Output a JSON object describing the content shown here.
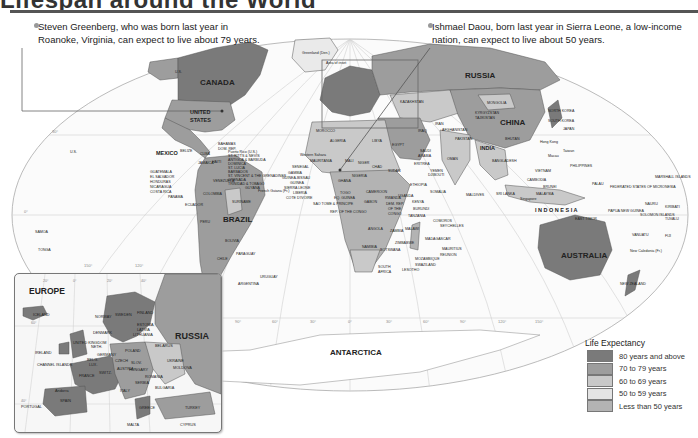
{
  "header": {
    "title": "Lifespan around the World"
  },
  "callouts": [
    {
      "id": "left",
      "text_line1": "Steven Greenberg, who was born last year in",
      "text_line2": "Roanoke, Virginia, can expect to live about 79 years."
    },
    {
      "id": "right",
      "text_line1": "Ishmael Daou, born last year in Sierra Leone, a low-income",
      "text_line2": "nation, can expect to live about 50 years."
    }
  ],
  "map": {
    "labels": {
      "canada": "CANADA",
      "us": "UNITED",
      "us2": "STATES",
      "russia": "RUSSIA",
      "china": "CHINA",
      "brazil": "BRAZIL",
      "australia": "AUSTRALIA",
      "antarctica": "ANTARCTICA",
      "indonesia": "I N D O N E S I A",
      "mexico": "MEXICO",
      "india": "INDIA",
      "mongolia": "MONGOLIA",
      "kazakhstan": "KAZAKHSTAN",
      "algeria": "ALGERIA",
      "libya": "LIBYA",
      "egypt": "EGYPT",
      "morocco": "MOROCCO",
      "sudan": "SUDAN",
      "chad": "CHAD",
      "niger": "NIGER",
      "mali": "MALI",
      "mauritania": "MAURITANIA",
      "nigeria": "NIGERIA",
      "ethiopia": "ETHIOPIA",
      "somalia": "SOMALIA",
      "kenya": "KENYA",
      "tanzania": "TANZANIA",
      "angola": "ANGOLA",
      "zambia": "ZAMBIA",
      "namibia": "NAMIBIA",
      "botswana": "BOTSWANA",
      "south_africa": "SOUTH",
      "south_africa2": "AFRICA",
      "madagascar": "MADAGASCAR",
      "mozambique": "MOZAMBIQUE",
      "drc": "DEM. REP.",
      "drc2": "OF THE",
      "drc3": "CONGO",
      "saudi": "SAUDI",
      "saudi2": "ARABIA",
      "iran": "IRAN",
      "iraq": "IRAQ",
      "pakistan": "PAKISTAN",
      "afghanistan": "AFGHANISTAN",
      "oman": "OMAN",
      "yemen": "YEMEN",
      "peru": "PERU",
      "bolivia": "BOLIVIA",
      "chile": "CHILE",
      "argentina": "ARGENTINA",
      "paraguay": "PARAGUAY",
      "uruguay": "URUGUAY",
      "colombia": "COLOMBIA",
      "venezuela": "VENEZUELA",
      "ecuador": "ECUADOR",
      "suriname": "SURINAME",
      "french_guiana": "French Guiana (Fr.)",
      "guatemala": "GUATEMALA",
      "el_salvador": "EL SALVADOR",
      "honduras": "HONDURAS",
      "nicaragua": "NICARAGUA",
      "costa_rica": "COSTA RICA",
      "panama": "PANAMA",
      "cuba": "CUBA",
      "belize": "BELIZE",
      "bahamas": "BAHAMAS",
      "dom_rep": "DOM. REP.",
      "jamaica": "JAMAICA",
      "haiti": "HAITI",
      "philippines": "PHILIPPINES",
      "vietnam": "VIETNAM",
      "cambodia": "CAMBODIA",
      "malaysia": "MALAYSIA",
      "brunei": "BRUNEI",
      "singapore": "Singapore",
      "papua": "PAPUA NEW GUINEA",
      "solomon": "SOLOMON ISLANDS",
      "new_zealand": "NEW ZEALAND",
      "new_caledonia": "New Caledonia (Fr.)",
      "vanuatu": "VANUATU",
      "fiji": "FIJI",
      "tuvalu": "TUVALU",
      "kiribati": "KIRIBATI",
      "nauru": "NAURU",
      "marshall": "MARSHALL ISLANDS",
      "micronesia": "FEDERATED STATES OF MICRONESIA",
      "palau": "PALAU",
      "bangladesh": "BANGLADESH",
      "sri_lanka": "SRI LANKA",
      "maldives": "MALDIVES",
      "bhutan": "BHUTAN",
      "nepal": "NEPAL",
      "north_korea": "NORTH KOREA",
      "south_korea": "SOUTH KOREA",
      "japan": "JAPAN",
      "taiwan": "Taiwan",
      "macau": "Macau",
      "hong_kong": "Hong Kong",
      "uzbekistan": "UZBEKISTAN",
      "kyrgyzstan": "KYRGYZSTAN",
      "tajikistan": "TAJIKISTAN",
      "greenland": "Greenland (Den.)",
      "area_inset": "Area of inset",
      "us_hawaii": "U.S.",
      "us_alaska": "U.S.",
      "samoa": "SAMOA",
      "tonga": "TONGA",
      "western_sahara": "Western Sahara",
      "senegal": "SENEGAL",
      "gambia": "GAMBIA",
      "guinea_bissau": "GUINEA-BISSAU",
      "guinea": "GUINEA",
      "sierra_leone": "SIERRA LEONE",
      "liberia": "LIBERIA",
      "cote": "COTE D'IVOIRE",
      "ghana": "GHANA",
      "togo": "TOGO",
      "eq_guinea": "EQ. GUINEA",
      "sao_tome": "SAO TOME & PRINCIPE",
      "rep_congo": "REP. OF THE CONGO",
      "gabon": "GABON",
      "cameroon": "CAMEROON",
      "eritrea": "ERITREA",
      "djibouti": "DJIBOUTI",
      "uganda": "UGANDA",
      "rwanda": "RWANDA",
      "burundi": "BURUNDI",
      "malawi": "MALAWI",
      "zimbabwe": "ZIMBABWE",
      "swaziland": "SWAZILAND",
      "lesotho": "LESOTHO",
      "comoros": "COMOROS",
      "seychelles": "SEYCHELLES",
      "mauritius": "MAURITIUS",
      "reunion": "REUNION",
      "timor": "EAST TIMOR",
      "puerto_rico": "Puerto Rico (U.S.)",
      "st_kitts": "ST. KITTS & NEVIS",
      "antigua": "ANTIGUA & BARBUDA",
      "dominica": "DOMINICA",
      "st_lucia": "ST. LUCIA",
      "barbados": "BARBADOS",
      "st_vincent": "ST. VINCENT & THE GRENADINES",
      "grenada": "GRENADA",
      "trinidad": "TRINIDAD & TOBAGO",
      "guyana": "GUYANA"
    },
    "graticule": {
      "lat": [
        "30°",
        "0°",
        "30°"
      ],
      "lon": [
        "150°",
        "120°",
        "90°",
        "60°",
        "30°",
        "0°",
        "30°",
        "60°",
        "90°",
        "120°",
        "150°"
      ]
    }
  },
  "inset": {
    "title": "EUROPE",
    "labels": {
      "russia": "RUSSIA",
      "iceland": "ICELAND",
      "ireland": "IRELAND",
      "uk": "UNITED KINGDOM",
      "channel": "CHANNEL ISLANDS",
      "france": "FRANCE",
      "spain": "SPAIN",
      "portugal": "PORTUGAL",
      "andorra": "Andorra",
      "germany": "GERMANY",
      "poland": "POLAND",
      "norway": "NORWAY",
      "sweden": "SWEDEN",
      "finland": "FINLAND",
      "denmark": "DENMARK",
      "estonia": "ESTONIA",
      "latvia": "LATVIA",
      "lithuania": "LITHUANIA",
      "belarus": "BELARUS",
      "ukraine": "UKRAINE",
      "moldova": "MOLDOVA",
      "romania": "ROMANIA",
      "bulgaria": "BULGARIA",
      "serbia": "SERBIA",
      "hungary": "HUNGARY",
      "czech": "CZECH",
      "austria": "AUSTRIA",
      "switz": "SWITZ.",
      "italy": "ITALY",
      "belgium": "BELG.",
      "netherlands": "NETH.",
      "lux": "LUX.",
      "greece": "GREECE",
      "turkey": "TURKEY",
      "cyprus": "CYPRUS",
      "malta": "MALTA",
      "slovakia": "SLOV."
    },
    "graticule": {
      "lon": [
        "20°",
        "0°",
        "20°",
        "40°"
      ],
      "lat": [
        "60°",
        "40°"
      ]
    }
  },
  "legend": {
    "title": "Life Expectancy",
    "items": [
      {
        "label": "80 years and above",
        "color": "#7a7a7a"
      },
      {
        "label": "70 to 79 years",
        "color": "#9d9d9d"
      },
      {
        "label": "60 to 69 years",
        "color": "#c9c9c9"
      },
      {
        "label": "50 to 59 years",
        "color": "#e4e4e4"
      },
      {
        "label": "Less than 50 years",
        "color": "#b3b3b3"
      }
    ]
  },
  "colors": {
    "ocean": "#fafafa",
    "graticule": "#c8c8c8",
    "border": "#666666"
  }
}
